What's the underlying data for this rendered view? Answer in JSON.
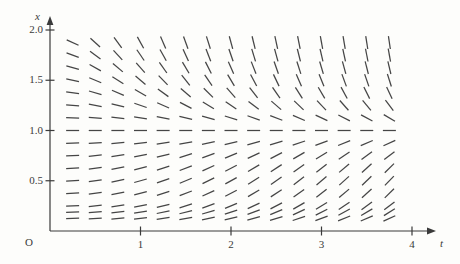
{
  "figure": {
    "background_color": "#fdfdfb",
    "stroke_color": "#454545",
    "axis_color": "#3a3a3a",
    "origin_label": "O",
    "x_axis_label": "t",
    "y_axis_label": "x"
  },
  "axes": {
    "t": {
      "label": "t",
      "ticks": [
        "1",
        "2",
        "3",
        "4"
      ],
      "tick_values": [
        1,
        2,
        3,
        4
      ],
      "range": [
        0,
        4.35
      ]
    },
    "x": {
      "label": "x",
      "ticks": [
        "0.5",
        "1.0",
        "1.5",
        "2.0"
      ],
      "tick_values": [
        0.5,
        1.0,
        1.5,
        2.0
      ],
      "range": [
        0,
        2.08
      ]
    }
  },
  "chart_data": {
    "type": "scatter",
    "plot_kind": "slope-field",
    "title": "",
    "xlabel": "t",
    "ylabel": "x",
    "xlim": [
      0,
      4.35
    ],
    "ylim": [
      0,
      2.08
    ],
    "xticks": [
      1,
      2,
      3,
      4
    ],
    "yticks": [
      0.5,
      1.0,
      1.5,
      2.0
    ],
    "xticklabels": [
      "1",
      "2",
      "3",
      "4"
    ],
    "yticklabels": [
      "0.5",
      "1.0",
      "1.5",
      "2.0"
    ],
    "grid": false,
    "legend": null,
    "equation": "dx/dt = t*x*(1-x)",
    "equilibrium_lines": [
      1.0
    ],
    "grid_t": [
      0.25,
      0.5,
      0.75,
      1.0,
      1.25,
      1.5,
      1.75,
      2.0,
      2.25,
      2.5,
      2.75,
      3.0,
      3.25,
      3.5,
      3.75
    ],
    "grid_x": [
      1.875,
      1.75,
      1.625,
      1.5,
      1.375,
      1.25,
      1.125,
      1.0,
      0.875,
      0.75,
      0.625,
      0.5,
      0.375,
      0.25,
      0.1875,
      0.125
    ],
    "tick_length_px": 13,
    "n_columns": 15,
    "n_rows": 16,
    "slopes": [
      [
        -0.41,
        -0.82,
        -1.23,
        -1.64,
        -2.05,
        -2.46,
        -2.87,
        -3.28,
        -3.69,
        -4.1,
        -4.51,
        -4.92,
        -5.33,
        -5.74,
        -6.15
      ],
      [
        -0.33,
        -0.66,
        -0.98,
        -1.31,
        -1.64,
        -1.97,
        -2.3,
        -2.63,
        -2.95,
        -3.28,
        -3.61,
        -3.94,
        -4.27,
        -4.59,
        -4.92
      ],
      [
        -0.25,
        -0.51,
        -0.76,
        -1.02,
        -1.27,
        -1.52,
        -1.78,
        -2.03,
        -2.29,
        -2.54,
        -2.79,
        -3.05,
        -3.3,
        -3.56,
        -3.81
      ],
      [
        -0.19,
        -0.38,
        -0.56,
        -0.75,
        -0.94,
        -1.13,
        -1.31,
        -1.5,
        -1.69,
        -1.88,
        -2.06,
        -2.25,
        -2.44,
        -2.63,
        -2.81
      ],
      [
        -0.13,
        -0.26,
        -0.39,
        -0.52,
        -0.65,
        -0.77,
        -0.9,
        -1.03,
        -1.16,
        -1.29,
        -1.42,
        -1.55,
        -1.68,
        -1.81,
        -1.93
      ],
      [
        -0.08,
        -0.16,
        -0.23,
        -0.31,
        -0.39,
        -0.47,
        -0.55,
        -0.63,
        -0.7,
        -0.78,
        -0.86,
        -0.94,
        -1.02,
        -1.09,
        -1.17
      ],
      [
        -0.04,
        -0.07,
        -0.11,
        -0.14,
        -0.18,
        -0.21,
        -0.25,
        -0.28,
        -0.32,
        -0.35,
        -0.39,
        -0.42,
        -0.46,
        -0.49,
        -0.53
      ],
      [
        0,
        0,
        0,
        0,
        0,
        0,
        0,
        0,
        0,
        0,
        0,
        0,
        0,
        0,
        0
      ],
      [
        0.03,
        0.05,
        0.08,
        0.11,
        0.14,
        0.16,
        0.19,
        0.22,
        0.25,
        0.27,
        0.3,
        0.33,
        0.36,
        0.38,
        0.41
      ],
      [
        0.05,
        0.09,
        0.14,
        0.19,
        0.23,
        0.28,
        0.33,
        0.38,
        0.42,
        0.47,
        0.52,
        0.56,
        0.61,
        0.66,
        0.7
      ],
      [
        0.06,
        0.12,
        0.18,
        0.23,
        0.29,
        0.35,
        0.41,
        0.47,
        0.53,
        0.59,
        0.64,
        0.7,
        0.76,
        0.82,
        0.88
      ],
      [
        0.06,
        0.13,
        0.19,
        0.25,
        0.31,
        0.38,
        0.44,
        0.5,
        0.56,
        0.63,
        0.69,
        0.75,
        0.81,
        0.88,
        0.94
      ],
      [
        0.06,
        0.12,
        0.18,
        0.23,
        0.29,
        0.35,
        0.41,
        0.47,
        0.53,
        0.59,
        0.64,
        0.7,
        0.76,
        0.82,
        0.88
      ],
      [
        0.05,
        0.09,
        0.14,
        0.19,
        0.23,
        0.28,
        0.33,
        0.38,
        0.42,
        0.47,
        0.52,
        0.56,
        0.61,
        0.66,
        0.7
      ],
      [
        0.04,
        0.08,
        0.11,
        0.15,
        0.19,
        0.23,
        0.27,
        0.3,
        0.34,
        0.38,
        0.42,
        0.46,
        0.49,
        0.53,
        0.57
      ],
      [
        0.03,
        0.05,
        0.08,
        0.11,
        0.14,
        0.16,
        0.19,
        0.22,
        0.25,
        0.27,
        0.3,
        0.33,
        0.36,
        0.38,
        0.41
      ]
    ]
  },
  "geometry": {
    "origin_px": {
      "x": 50,
      "y": 231
    },
    "t_unit_px": 90.5,
    "x_unit_px": 100.5,
    "t_axis_end_px": 436,
    "x_axis_top_px": 16
  }
}
